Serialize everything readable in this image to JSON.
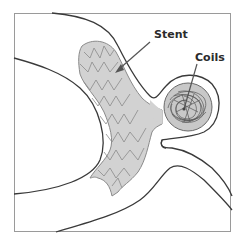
{
  "diagram": {
    "labels": {
      "stent": "Stent",
      "coils": "Coils"
    },
    "colors": {
      "vessel_outline": "#3a3a3a",
      "stent_fill": "#d2d2d2",
      "stent_mesh": "#8a8a8a",
      "coil_color": "#555555",
      "frame": "#9a9a9a",
      "label_text": "#2b2b2b"
    },
    "elements": [
      {
        "name": "vessel-wall",
        "kind": "outline"
      },
      {
        "name": "stent",
        "kind": "mesh-tube"
      },
      {
        "name": "aneurysm-sac",
        "kind": "circle"
      },
      {
        "name": "coils",
        "kind": "tangle"
      },
      {
        "name": "stent-pointer-arrow",
        "kind": "arrow"
      },
      {
        "name": "coils-pointer-arrow",
        "kind": "arrow"
      }
    ]
  }
}
